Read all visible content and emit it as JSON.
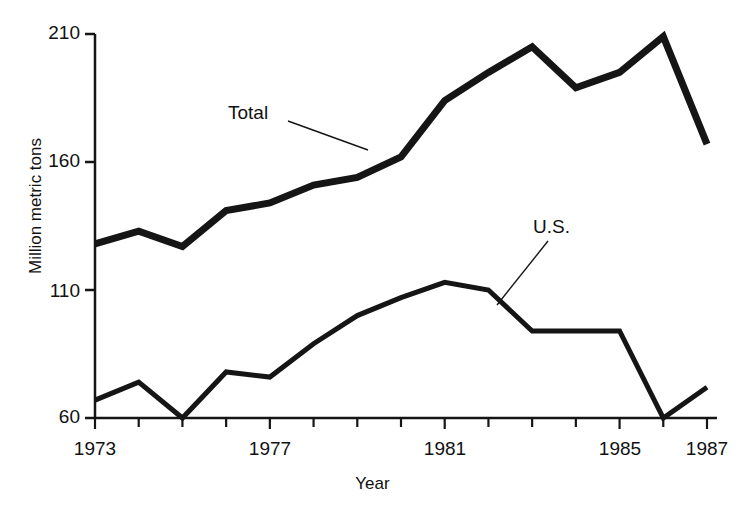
{
  "chart_data": {
    "type": "line",
    "title": "",
    "subtitle": "",
    "xlabel": "Year",
    "ylabel": "Million metric tons",
    "x": [
      1973,
      1974,
      1975,
      1976,
      1977,
      1978,
      1979,
      1980,
      1981,
      1982,
      1983,
      1984,
      1985,
      1986,
      1987
    ],
    "xlim": [
      1973,
      1987
    ],
    "ylim": [
      60,
      210
    ],
    "y_ticks": [
      60,
      110,
      160,
      210
    ],
    "y_tick_labels": [
      "60",
      "110",
      "160",
      "210"
    ],
    "x_ticks": [
      1973,
      1974,
      1975,
      1976,
      1977,
      1978,
      1979,
      1980,
      1981,
      1982,
      1983,
      1984,
      1985,
      1986,
      1987
    ],
    "x_tick_labels_shown": [
      "1973",
      "1977",
      "1981",
      "1985",
      "1987"
    ],
    "x_tick_labels_shown_at": [
      1973,
      1977,
      1981,
      1985,
      1987
    ],
    "grid": false,
    "legend": "inline-annotations",
    "series": [
      {
        "name": "Total",
        "label": "Total",
        "color": "#151515",
        "line_width": 7,
        "values": [
          128,
          133,
          127,
          141,
          144,
          151,
          154,
          162,
          184,
          195,
          205,
          189,
          195,
          209,
          167
        ]
      },
      {
        "name": "U.S.",
        "label": "U.S.",
        "color": "#151515",
        "line_width": 5,
        "values": [
          67,
          74,
          60,
          78,
          76,
          89,
          100,
          107,
          113,
          110,
          94,
          94,
          94,
          60,
          72
        ]
      }
    ],
    "annotations": [
      {
        "name": "total-annotation",
        "text": "Total",
        "label_x": 228,
        "label_y": 102,
        "leader_from_x": 288,
        "leader_from_y": 121,
        "leader_to_x": 368,
        "leader_to_y": 150
      },
      {
        "name": "us-annotation",
        "text": "U.S.",
        "label_x": 533,
        "label_y": 216,
        "leader_from_x": 548,
        "leader_from_y": 241,
        "leader_to_x": 497,
        "leader_to_y": 305
      }
    ]
  },
  "axes": {
    "y_title": "Million metric tons",
    "x_title": "Year",
    "axis_color": "#151515",
    "y_labels": [
      {
        "text": "210",
        "top": 22
      },
      {
        "text": "160",
        "top": 150
      },
      {
        "text": "110",
        "top": 280
      },
      {
        "text": "60",
        "top": 406
      }
    ],
    "x_labels": [
      {
        "text": "1973",
        "left": 95
      },
      {
        "text": "1977",
        "left": 270
      },
      {
        "text": "1981",
        "left": 445
      },
      {
        "text": "1985",
        "left": 620
      },
      {
        "text": "1987",
        "left": 707
      }
    ]
  }
}
